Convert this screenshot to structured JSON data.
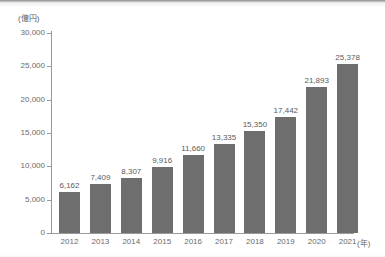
{
  "chart_data": {
    "type": "bar",
    "title": "",
    "xlabel": "(年)",
    "ylabel": "(億円)",
    "categories": [
      "2012",
      "2013",
      "2014",
      "2015",
      "2016",
      "2017",
      "2018",
      "2019",
      "2020",
      "2021"
    ],
    "values": [
      6162,
      7409,
      8307,
      9916,
      11660,
      13335,
      15350,
      17442,
      21893,
      25378
    ],
    "value_labels": [
      "6,162",
      "7,409",
      "8,307",
      "9,916",
      "11,660",
      "13,335",
      "15,350",
      "17,442",
      "21,893",
      "25,378"
    ],
    "ylim": [
      0,
      30000
    ],
    "ytick_values": [
      0,
      5000,
      10000,
      15000,
      20000,
      25000,
      30000
    ],
    "ytick_labels": [
      "0",
      "5,000",
      "10,000",
      "15,000",
      "20,000",
      "25,000",
      "30,000"
    ],
    "grid": false,
    "legend": false,
    "bar_color": "#6e6e6e",
    "axis_color": "#9a9a9a",
    "label_color": "#6a6a6a",
    "background": "#ffffff"
  }
}
